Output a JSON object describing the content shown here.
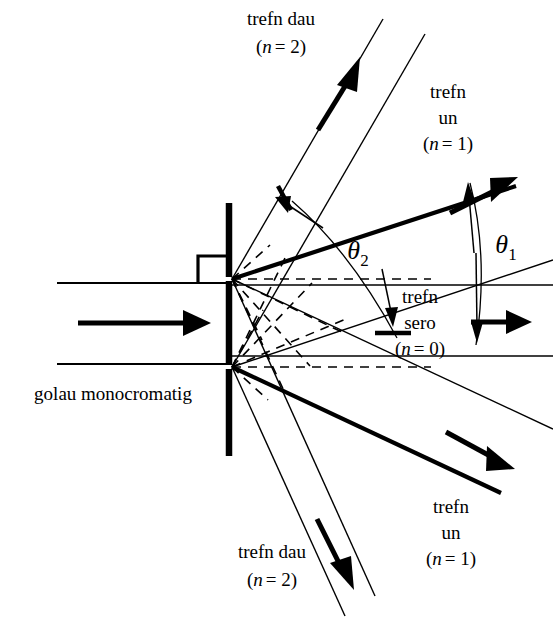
{
  "figure": {
    "background_color": "#ffffff",
    "line_color": "#000000",
    "width": 553,
    "height": 638
  },
  "labels": {
    "source": "golau monocromatig",
    "order_top2_name": "trefn dau",
    "order_top2_order": "(n = 2)",
    "order_top1_name_line1": "trefn",
    "order_top1_name_line2": "un",
    "order_top1_order": "(n = 1)",
    "order_zero_name_line1": "trefn",
    "order_zero_name_line2": "sero",
    "order_zero_order": "(n = 0)",
    "order_bot1_name_line1": "trefn",
    "order_bot1_name_line2": "un",
    "order_bot1_order": "(n = 1)",
    "order_bot2_name": "trefn dau",
    "order_bot2_order": "(n = 2)",
    "theta_one_symbol": "θ",
    "theta_one_subscript": "1",
    "theta_two_symbol": "θ",
    "theta_two_subscript": "2"
  },
  "annotations": {
    "n_italic_top2": "n",
    "n_italic_top1": "n",
    "n_italic_zero": "n",
    "n_italic_bot1": "n",
    "n_italic_bot2": "n",
    "eq_top2": "= 2)",
    "eq_top1": "= 1)",
    "eq_zero": "= 0)",
    "eq_bot1": "= 1)",
    "eq_bot2": "= 2)",
    "open_paren": "("
  },
  "geometry": {
    "barrier_x": 229,
    "barrier_top_y": 203,
    "barrier_bottom_y": 456,
    "slit_upper_y": 279,
    "slit_lower_y": 367,
    "incoming_beam_top_y": 283,
    "incoming_beam_bottom_y": 364,
    "incoming_beam_left_x": 57,
    "zero_order_angle_deg": 0,
    "first_order_angle_deg": 24,
    "second_order_angle_deg": 52
  }
}
